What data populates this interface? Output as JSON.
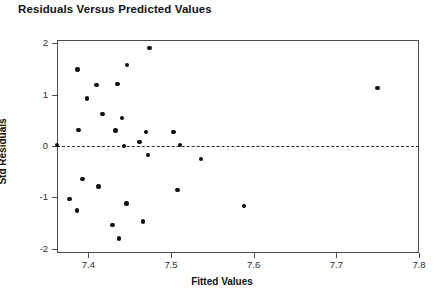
{
  "chart_data": {
    "type": "scatter",
    "title": "Residuals Versus Predicted Values",
    "xlabel": "Fitted Values",
    "ylabel": "Std Residuals",
    "xlim": [
      7.362,
      7.8
    ],
    "ylim": [
      -2.08,
      2.06
    ],
    "xticks": [
      7.4,
      7.5,
      7.6,
      7.7,
      7.8
    ],
    "xtick_labels": [
      "7.4",
      "7.5",
      "7.6",
      "7.7",
      "7.8"
    ],
    "yticks": [
      2,
      1,
      0,
      -1,
      -2
    ],
    "ytick_labels": [
      "2",
      "1",
      "0",
      "-1",
      "-2"
    ],
    "grid": false,
    "legend": null,
    "reference_lines": [
      {
        "name": "zero-residual-line",
        "orientation": "horizontal",
        "y": 0,
        "style": "dashed",
        "color": "#2b2b2b"
      }
    ],
    "marker": {
      "shape": "circle",
      "color": "#0d0d0d",
      "size": 4.4
    },
    "points": [
      {
        "x": 7.387,
        "y": 1.49
      },
      {
        "x": 7.41,
        "y": 1.18
      },
      {
        "x": 7.435,
        "y": 1.21
      },
      {
        "x": 7.398,
        "y": 0.92
      },
      {
        "x": 7.447,
        "y": 1.57
      },
      {
        "x": 7.474,
        "y": 1.9
      },
      {
        "x": 7.417,
        "y": 0.62
      },
      {
        "x": 7.441,
        "y": 0.54
      },
      {
        "x": 7.433,
        "y": 0.3
      },
      {
        "x": 7.388,
        "y": 0.31
      },
      {
        "x": 7.47,
        "y": 0.27
      },
      {
        "x": 7.503,
        "y": 0.27
      },
      {
        "x": 7.362,
        "y": 0.02
      },
      {
        "x": 7.443,
        "y": 0.0
      },
      {
        "x": 7.462,
        "y": 0.08
      },
      {
        "x": 7.511,
        "y": 0.02
      },
      {
        "x": 7.472,
        "y": -0.18
      },
      {
        "x": 7.536,
        "y": -0.25
      },
      {
        "x": 7.393,
        "y": -0.64
      },
      {
        "x": 7.412,
        "y": -0.79
      },
      {
        "x": 7.508,
        "y": -0.86
      },
      {
        "x": 7.377,
        "y": -1.03
      },
      {
        "x": 7.446,
        "y": -1.12
      },
      {
        "x": 7.588,
        "y": -1.17
      },
      {
        "x": 7.386,
        "y": -1.25
      },
      {
        "x": 7.466,
        "y": -1.47
      },
      {
        "x": 7.429,
        "y": -1.53
      },
      {
        "x": 7.437,
        "y": -1.8
      },
      {
        "x": 7.75,
        "y": 1.13
      }
    ]
  }
}
